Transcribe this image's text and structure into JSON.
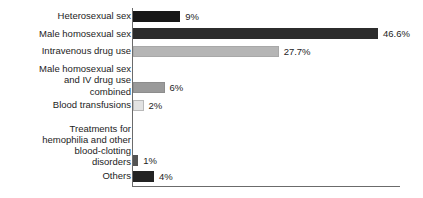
{
  "chart_data": {
    "type": "bar",
    "orientation": "horizontal",
    "title": "",
    "subtitle": "",
    "xlabel": "",
    "ylabel": "",
    "grid": false,
    "legend": false,
    "xlim": [
      0,
      50
    ],
    "categories": [
      "Heterosexual sex",
      "Male homosexual sex",
      "Intravenous drug use",
      "Male homosexual sex\nand IV drug use\ncombined",
      "Blood transfusions",
      "Treatments for\nhemophilia and other\nblood-clotting\ndisorders",
      "Others"
    ],
    "values": [
      9,
      46.6,
      27.7,
      6,
      2,
      1,
      4
    ],
    "value_labels": [
      "9%",
      "46.6%",
      "27.7%",
      "6%",
      "2%",
      "1%",
      "4%"
    ],
    "bar_colors": [
      "#171717",
      "#2c2c2c",
      "#b5b5b5",
      "#9a9a9a",
      "#e2e2e2",
      "#545454",
      "#232323"
    ],
    "bar_borders": [
      "#171717",
      "#2c2c2c",
      "#a8a8a8",
      "#8d8d8d",
      "#b9b9b9",
      "#545454",
      "#232323"
    ],
    "axis_color": "#6b6b6b",
    "background_color": "#ffffff"
  }
}
